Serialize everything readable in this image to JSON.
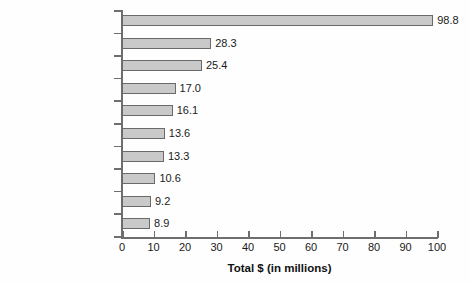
{
  "chart_data": {
    "type": "bar",
    "orientation": "horizontal",
    "title": "",
    "xlabel": "Total $ (in millions)",
    "ylabel": "",
    "xlim": [
      0,
      100
    ],
    "xticks": [
      0,
      10,
      20,
      30,
      40,
      50,
      60,
      70,
      80,
      90,
      100
    ],
    "xtick_labels": [
      "0",
      "10",
      "20",
      "30",
      "40",
      "50",
      "60",
      "70",
      "80",
      "90",
      "100"
    ],
    "grid": false,
    "legend": null,
    "categories": [
      "Insurance",
      "Party Committees",
      "General Trade Unions",
      "Public Sector Unions",
      "Health Professionals",
      "Gambling and Casinos",
      "Lawyers and Lobbyists",
      "Real Estate",
      "Tribal Governments",
      "Health Services"
    ],
    "values": [
      98.8,
      28.3,
      25.4,
      17.0,
      16.1,
      13.6,
      13.3,
      10.6,
      9.2,
      8.9
    ],
    "value_labels": [
      "98.8",
      "28.3",
      "25.4",
      "17.0",
      "16.1",
      "13.6",
      "13.3",
      "10.6",
      "9.2",
      "8.9"
    ],
    "bar_fill_color": "#c9c9c9",
    "bar_edge_color": "#6a6a6a",
    "axis_color": "#6e6e6e",
    "text_color": "#1a1a1a",
    "background_color": "#fefefe"
  }
}
